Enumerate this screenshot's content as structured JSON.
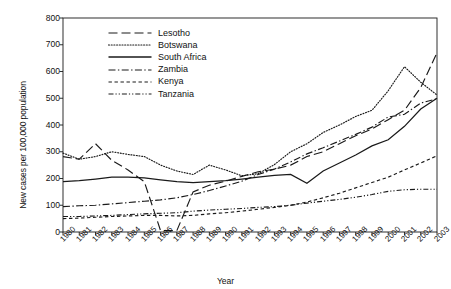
{
  "chart_data": {
    "type": "line",
    "title": "",
    "xlabel": "Year",
    "ylabel": "New cases per 100,000 population",
    "xlim": [
      1980,
      2003
    ],
    "ylim": [
      0,
      800
    ],
    "yticks": [
      0,
      100,
      200,
      300,
      400,
      500,
      600,
      700,
      800
    ],
    "grid": false,
    "legend_position": "top-left-inside",
    "x": [
      1980,
      1981,
      1982,
      1983,
      1984,
      1985,
      1986,
      1987,
      1988,
      1989,
      1990,
      1991,
      1992,
      1993,
      1994,
      1995,
      1996,
      1997,
      1998,
      1999,
      2000,
      2001,
      2002,
      2003
    ],
    "categories": [
      "1980",
      "1981",
      "1982",
      "1983",
      "1984",
      "1985",
      "1986",
      "1987",
      "1988",
      "1989",
      "1990",
      "1991",
      "1992",
      "1993",
      "1994",
      "1995",
      "1996",
      "1997",
      "1998",
      "1999",
      "2000",
      "2001",
      "2002",
      "2003"
    ],
    "series": [
      {
        "name": "Lesotho",
        "style": "dashed",
        "color": "#1a1a1a",
        "values": [
          282,
          272,
          330,
          268,
          232,
          188,
          5,
          5,
          150,
          175,
          190,
          208,
          225,
          235,
          250,
          282,
          300,
          330,
          360,
          385,
          420,
          455,
          540,
          670
        ]
      },
      {
        "name": "Botswana",
        "style": "dotted",
        "color": "#1a1a1a",
        "values": [
          295,
          272,
          282,
          300,
          290,
          282,
          250,
          228,
          215,
          250,
          232,
          210,
          218,
          252,
          300,
          330,
          372,
          400,
          432,
          455,
          528,
          618,
          560,
          512
        ]
      },
      {
        "name": "South Africa",
        "style": "solid",
        "color": "#1a1a1a",
        "values": [
          188,
          192,
          198,
          205,
          205,
          202,
          195,
          188,
          185,
          188,
          192,
          198,
          205,
          212,
          215,
          182,
          228,
          258,
          288,
          322,
          345,
          395,
          460,
          500
        ]
      },
      {
        "name": "Zambia",
        "style": "dashdot",
        "color": "#1a1a1a",
        "values": [
          95,
          98,
          100,
          105,
          110,
          115,
          120,
          128,
          140,
          155,
          172,
          190,
          215,
          235,
          262,
          292,
          315,
          340,
          365,
          392,
          430,
          440,
          482,
          498
        ]
      },
      {
        "name": "Kenya",
        "style": "dashed-short",
        "color": "#1a1a1a",
        "values": [
          50,
          52,
          55,
          58,
          60,
          62,
          62,
          60,
          62,
          68,
          72,
          78,
          85,
          92,
          100,
          112,
          128,
          145,
          165,
          185,
          205,
          232,
          258,
          285
        ]
      },
      {
        "name": "Tanzania",
        "style": "dashdotdot",
        "color": "#1a1a1a",
        "values": [
          58,
          58,
          60,
          62,
          65,
          68,
          70,
          72,
          78,
          82,
          85,
          88,
          92,
          95,
          100,
          108,
          115,
          122,
          130,
          140,
          152,
          158,
          160,
          160
        ]
      }
    ]
  },
  "axis": {
    "x_title": "Year",
    "y_title": "New cases per 100,000 population"
  }
}
